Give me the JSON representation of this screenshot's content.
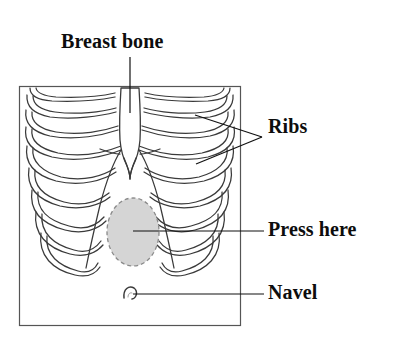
{
  "figure": {
    "type": "anatomical-diagram",
    "frame": {
      "x": 19,
      "y": 86,
      "width": 221,
      "height": 239,
      "border_color": "#555555"
    },
    "background_color": "#ffffff",
    "line_color": "#3a3a3a",
    "leader_line_color": "#111111"
  },
  "labels": {
    "breast_bone": "Breast bone",
    "ribs": "Ribs",
    "press_here": "Press here",
    "navel": "Navel"
  },
  "parts": {
    "sternum": {
      "name": "Breast bone",
      "fill": "#ffffff",
      "stroke": "#3a3a3a"
    },
    "ribs": {
      "name": "Ribs",
      "count_per_side": 9,
      "stroke": "#3a3a3a"
    },
    "press_target": {
      "name": "Press here",
      "shape": "ellipse",
      "center_x": 133,
      "center_y": 232,
      "radius_x": 26,
      "radius_y": 34,
      "fill": "#d5d5d5",
      "stroke": "#8a8a8a",
      "stroke_style": "dashed"
    },
    "navel": {
      "name": "Navel",
      "center_x": 131,
      "center_y": 295,
      "stroke": "#3a3a3a"
    }
  },
  "leaders": {
    "breast_bone": {
      "from_x": 130,
      "from_y": 57,
      "to_x": 130,
      "to_y": 113
    },
    "ribs_upper": {
      "from_x": 262,
      "from_y": 137,
      "to_x": 195,
      "to_y": 115
    },
    "ribs_lower": {
      "from_x": 262,
      "from_y": 137,
      "to_x": 196,
      "to_y": 164
    },
    "press_here": {
      "from_x": 133,
      "from_y": 231,
      "to_x": 264,
      "to_y": 231
    },
    "navel": {
      "from_x": 133,
      "from_y": 294,
      "to_x": 264,
      "to_y": 294
    }
  }
}
